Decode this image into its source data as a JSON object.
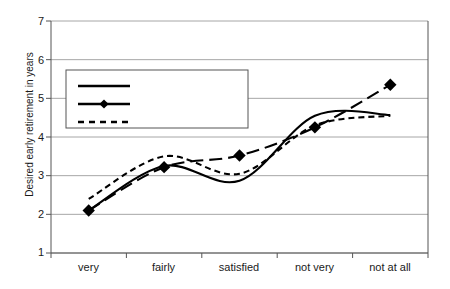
{
  "chart_data": {
    "type": "line",
    "title": "",
    "xlabel": "",
    "ylabel": "Desired early retirement in years",
    "categories": [
      "very",
      "fairly",
      "satisfied",
      "not very",
      "not at all"
    ],
    "ylim": [
      1,
      7
    ],
    "yticks": [
      1,
      2,
      3,
      4,
      5,
      6,
      7
    ],
    "grid": true,
    "legend_position": "upper-left-inside",
    "series": [
      {
        "name": "standard of living",
        "style": "solid",
        "marker": "none",
        "color": "#000000",
        "values": [
          2.1,
          3.25,
          2.87,
          4.55,
          4.57
        ]
      },
      {
        "name": "present work",
        "style": "dashed-long",
        "marker": "diamond",
        "color": "#000000",
        "values": [
          2.1,
          3.22,
          3.52,
          4.25,
          5.35
        ]
      },
      {
        "name": "time for doing things",
        "style": "dotted-dash",
        "marker": "none",
        "color": "#000000",
        "values": [
          2.4,
          3.5,
          3.05,
          4.3,
          4.55
        ]
      }
    ]
  },
  "axis": {
    "y_tick_labels": [
      "7",
      "6",
      "5",
      "4",
      "3",
      "2",
      "1"
    ],
    "x_tick_labels": [
      "very",
      "fairly",
      "satisfied",
      "not very",
      "not at all"
    ],
    "y_axis_title": "Desired early retirement in years"
  },
  "legend": {
    "entries": [
      {
        "label": "standard of living",
        "style": "solid"
      },
      {
        "label": "present work",
        "style": "dashed-marker"
      },
      {
        "label": "time for doing things",
        "style": "dotted"
      }
    ]
  },
  "colors": {
    "line": "#000000",
    "grid": "#a6a6a6",
    "axis": "#555555",
    "background": "#ffffff"
  }
}
